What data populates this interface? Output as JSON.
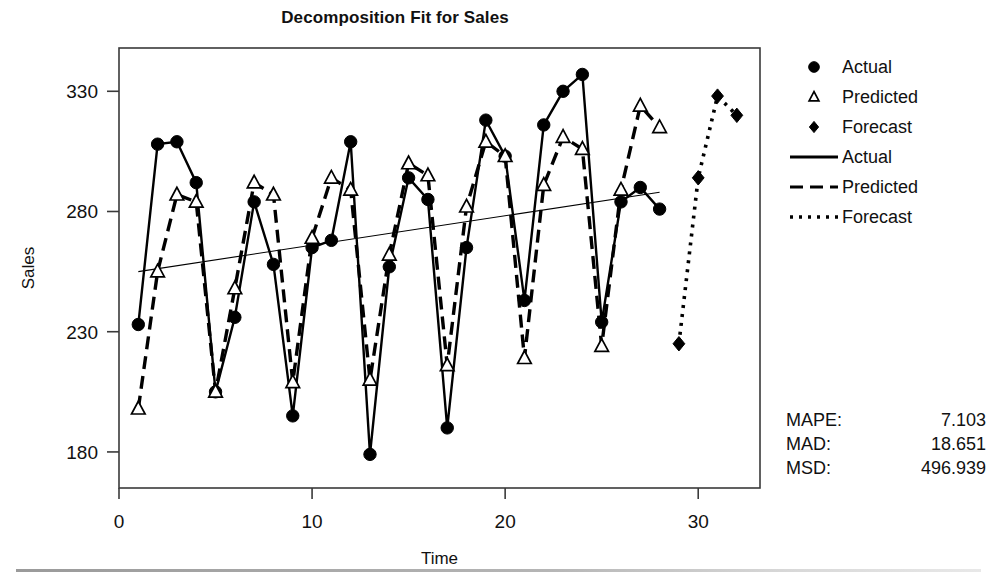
{
  "chart_data": {
    "type": "line",
    "title": "Decomposition Fit for Sales",
    "xlabel": "Time",
    "ylabel": "Sales",
    "xlim": [
      0.0,
      33.2
    ],
    "ylim": [
      165,
      348
    ],
    "xticks": [
      0,
      10,
      20,
      30
    ],
    "yticks": [
      180,
      230,
      280,
      330
    ],
    "grid": false,
    "legend_position": "right",
    "x": [
      1,
      2,
      3,
      4,
      5,
      6,
      7,
      8,
      9,
      10,
      11,
      12,
      13,
      14,
      15,
      16,
      17,
      18,
      19,
      20,
      21,
      22,
      23,
      24,
      25,
      26,
      27,
      28
    ],
    "series": [
      {
        "name": "Actual",
        "marker": "filled-circle",
        "linestyle": "solid",
        "x": [
          1,
          2,
          3,
          4,
          5,
          6,
          7,
          8,
          9,
          10,
          11,
          12,
          13,
          14,
          15,
          16,
          17,
          18,
          19,
          20,
          21,
          22,
          23,
          24,
          25,
          26,
          27,
          28
        ],
        "values": [
          233,
          308,
          309,
          292,
          205,
          236,
          284,
          258,
          195,
          265,
          268,
          309,
          179,
          257,
          294,
          285,
          190,
          265,
          318,
          303,
          243,
          316,
          330,
          337,
          234,
          284,
          290,
          281
        ]
      },
      {
        "name": "Predicted",
        "marker": "open-triangle",
        "linestyle": "dashed",
        "x": [
          1,
          2,
          3,
          4,
          5,
          6,
          7,
          8,
          9,
          10,
          11,
          12,
          13,
          14,
          15,
          16,
          17,
          18,
          19,
          20,
          21,
          22,
          23,
          24,
          25,
          26,
          27,
          28
        ],
        "values": [
          198,
          255,
          287,
          284,
          205,
          248,
          292,
          287,
          209,
          269,
          294,
          289,
          210,
          262,
          300,
          295,
          216,
          282,
          309,
          303,
          219,
          291,
          311,
          306,
          224,
          289,
          324,
          315
        ]
      },
      {
        "name": "Forecast",
        "marker": "filled-diamond",
        "linestyle": "dotted",
        "x": [
          29,
          30,
          31,
          32
        ],
        "values": [
          225,
          294,
          328,
          320
        ]
      },
      {
        "name": "Trend",
        "marker": "none",
        "linestyle": "thin-solid",
        "x": [
          1,
          28
        ],
        "values": [
          255,
          288
        ]
      }
    ],
    "legend_entries": [
      {
        "label": "Actual",
        "kind": "marker",
        "glyph": "filled-circle"
      },
      {
        "label": "Predicted",
        "kind": "marker",
        "glyph": "open-triangle"
      },
      {
        "label": "Forecast",
        "kind": "marker",
        "glyph": "filled-diamond"
      },
      {
        "label": "Actual",
        "kind": "line",
        "glyph": "solid-line"
      },
      {
        "label": "Predicted",
        "kind": "line",
        "glyph": "dashed-line"
      },
      {
        "label": "Forecast",
        "kind": "line",
        "glyph": "dotted-line"
      }
    ],
    "annotations": {
      "accuracy_measures": [
        {
          "label": "MAPE:",
          "value": "7.103"
        },
        {
          "label": "MAD:",
          "value": "18.651"
        },
        {
          "label": "MSD:",
          "value": "496.939"
        }
      ]
    },
    "colors": {
      "foreground": "#000000",
      "background": "#ffffff",
      "frame": "#3a3a3a",
      "rule": "#a0a0a0"
    }
  }
}
